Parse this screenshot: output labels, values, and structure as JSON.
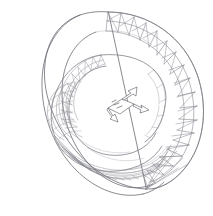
{
  "canvas": {
    "width": 213,
    "height": 216,
    "background_color": "#ffffff",
    "title": "Wireframe Torus Mesh"
  },
  "render": {
    "style": "line-art wireframe",
    "projection": "isometric-perspective",
    "line_color": "#6b6b73",
    "mesh_color": "#8b8b95",
    "fill": "none"
  },
  "model": {
    "name": "nested-torus-wireframe",
    "description": "Two concentric toroidal surfaces drawn as wireframe meshes viewed at an oblique angle, with a 3D axis triad marker at the center.",
    "components": [
      {
        "id": "outer-torus",
        "label": "Outer torus band",
        "mesh_type": "triangulated quads",
        "segments_u": 26,
        "segments_v": 4,
        "visible_sector": "upper-right arc",
        "stroke": "#7e7e88"
      },
      {
        "id": "inner-torus",
        "label": "Inner torus tube",
        "mesh_type": "quad grid",
        "segments_u": 32,
        "segments_v": 10,
        "visible_sector": "left and lower arc",
        "stroke": "#86868f"
      },
      {
        "id": "axis-triad",
        "label": "Axis orientation marker",
        "mesh_type": "arrow triad",
        "arrows": 3,
        "stroke": "#55555e"
      }
    ]
  },
  "geometry": {
    "outer_ring": {
      "center_x": 106,
      "center_y": 104,
      "radius_x": 104,
      "radius_y": 100,
      "tube_radius": 20,
      "tilt_deg": -18
    },
    "inner_ring": {
      "center_x": 96,
      "center_y": 104,
      "radius_x": 66,
      "radius_y": 58,
      "tube_radius": 17,
      "tilt_deg": -18
    },
    "axis_marker": {
      "origin_x": 118,
      "origin_y": 108,
      "arrow_length": 22
    }
  },
  "annotations": {
    "has_text_labels": false,
    "has_axis_ticks": false,
    "has_legend": false
  }
}
